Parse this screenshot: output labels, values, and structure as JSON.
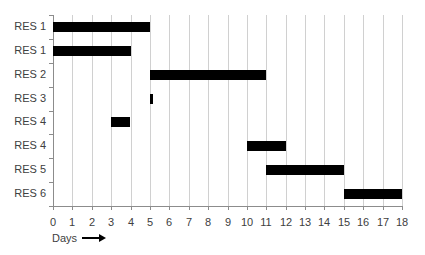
{
  "chart_data": {
    "type": "gantt",
    "title": "",
    "xlabel": "Days",
    "xlabel_arrow": "→",
    "ylabel": "",
    "xlim": [
      0,
      18
    ],
    "x_ticks": [
      0,
      1,
      2,
      3,
      4,
      5,
      6,
      7,
      8,
      9,
      10,
      11,
      12,
      13,
      14,
      15,
      16,
      17,
      18
    ],
    "grid": "vertical",
    "bar_color": "#000000",
    "categories": [
      "RES 1",
      "RES 1",
      "RES 2",
      "RES 3",
      "RES 4",
      "RES 4",
      "RES 5",
      "RES 6"
    ],
    "bars": [
      {
        "label": "RES 1",
        "start": 0,
        "end": 5
      },
      {
        "label": "RES 1",
        "start": 0,
        "end": 4
      },
      {
        "label": "RES 2",
        "start": 5,
        "end": 11
      },
      {
        "label": "RES 3",
        "start": 5,
        "end": 5.15
      },
      {
        "label": "RES 4",
        "start": 3,
        "end": 4
      },
      {
        "label": "RES 4",
        "start": 10,
        "end": 12
      },
      {
        "label": "RES 5",
        "start": 11,
        "end": 15
      },
      {
        "label": "RES 6",
        "start": 15,
        "end": 18
      }
    ]
  }
}
